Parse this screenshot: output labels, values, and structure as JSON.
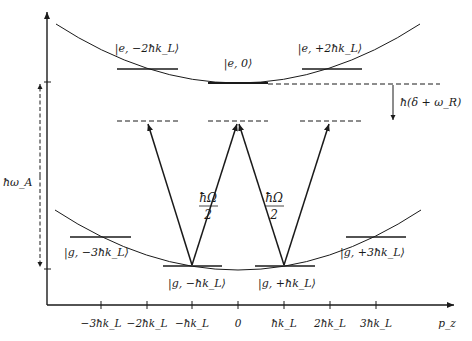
{
  "diagram": {
    "type": "energy-level-diagram",
    "colors": {
      "line": "#1a1a1a",
      "background": "#ffffff"
    },
    "axes": {
      "x_label": "p_z",
      "x_ticks": [
        "−3ħk_L",
        "−2ħk_L",
        "−ħk_L",
        "0",
        "ħk_L",
        "2ħk_L",
        "3ħk_L"
      ],
      "y_label_energy_gap": "ħω_A"
    },
    "excited_states": [
      {
        "label": "|e, −2ħk_L⟩",
        "momentum": -2
      },
      {
        "label": "|e, 0⟩",
        "momentum": 0
      },
      {
        "label": "|e, +2ħk_L⟩",
        "momentum": 2
      }
    ],
    "ground_states": [
      {
        "label": "|g, −3ħk_L⟩",
        "momentum": -3
      },
      {
        "label": "|g, −ħk_L⟩",
        "momentum": -1
      },
      {
        "label": "|g, +ħk_L⟩",
        "momentum": 1
      },
      {
        "label": "|g, +3ħk_L⟩",
        "momentum": 3
      }
    ],
    "couplings": [
      {
        "label_num": "ħΩ",
        "label_den": "2"
      },
      {
        "label_num": "ħΩ",
        "label_den": "2"
      }
    ],
    "detuning_label": "ħ(δ + ω_R)"
  }
}
